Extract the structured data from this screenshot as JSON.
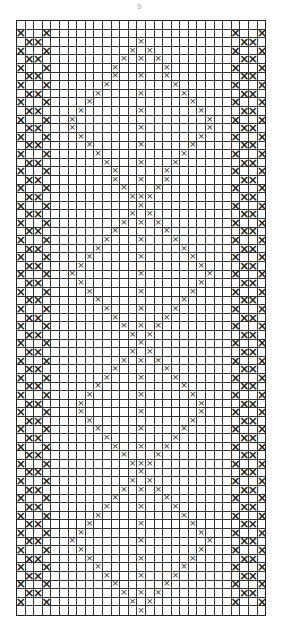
{
  "page_number": "9",
  "chart": {
    "cols": 29,
    "rows": 69,
    "cell_w": 8.6,
    "cell_h": 8.62,
    "grid_color": "#333333",
    "mark_color": "#222222",
    "symbol": "×",
    "center_col": 14,
    "diamond_half_width": 8,
    "diamond_vertices_rows": [
      2,
      21,
      37,
      52,
      68
    ],
    "diamond_mid_rows": [
      12,
      29,
      44,
      60
    ],
    "left_border_cols": [
      0,
      1,
      2,
      3
    ],
    "right_border_cols": [
      25,
      26,
      27,
      28
    ]
  }
}
